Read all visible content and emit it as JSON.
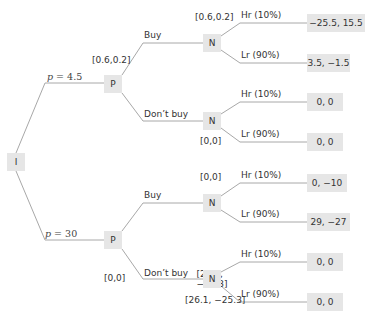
{
  "diagram": {
    "type": "game-tree",
    "root": {
      "label": "I",
      "branches": [
        {
          "price_var": "p",
          "price_text": " = 4.5",
          "node": {
            "label": "P",
            "value": "[0.6,0.2]",
            "branches": [
              {
                "action": "Buy",
                "node": {
                  "label": "N",
                  "value": "[0.6,0.2]",
                  "outcomes": [
                    {
                      "label": "Hr (10%)",
                      "payoff": "−25.5, 15.5"
                    },
                    {
                      "label": "Lr (90%)",
                      "payoff": "3.5, −1.5"
                    }
                  ]
                }
              },
              {
                "action": "Don’t buy",
                "node": {
                  "label": "N",
                  "value": "[0,0]",
                  "outcomes": [
                    {
                      "label": "Hr (10%)",
                      "payoff": "0, 0"
                    },
                    {
                      "label": "Lr (90%)",
                      "payoff": "0, 0"
                    }
                  ]
                }
              }
            ]
          }
        },
        {
          "price_var": "p",
          "price_text": " = 30",
          "node": {
            "label": "P",
            "value": "[0,0]",
            "branches": [
              {
                "action": "Buy",
                "node": {
                  "label": "N",
                  "value": "[0,0]",
                  "outcomes": [
                    {
                      "label": "Hr (10%)",
                      "payoff": "0, −10"
                    },
                    {
                      "label": "Lr (90%)",
                      "payoff": "29, −27"
                    }
                  ]
                }
              },
              {
                "action": "Don’t buy",
                "node": {
                  "label": "N",
                  "value": "[26.1, −25.3]",
                  "outcomes": [
                    {
                      "label": "Hr (10%)",
                      "payoff": "0, 0"
                    },
                    {
                      "label": "Lr (90%)",
                      "payoff": "0, 0"
                    }
                  ]
                }
              }
            ]
          }
        }
      ]
    }
  },
  "colors": {
    "node_fill": "#e6e6e6",
    "edge": "#a8a8a8",
    "text": "#333333"
  }
}
